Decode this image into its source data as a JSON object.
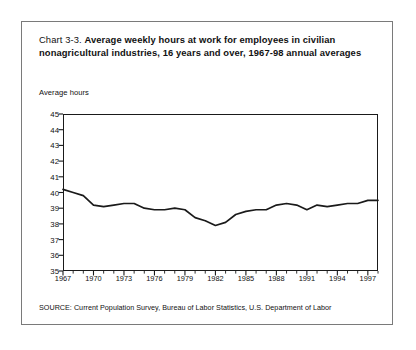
{
  "figure": {
    "number": "Chart 3-3.",
    "title": "Average weekly hours at work for employees in civilian nonagricultural industries, 16 years and over, 1967-98 annual averages",
    "y_axis_label": "Average hours",
    "source": "SOURCE: Current Population Survey, Bureau of Labor Statistics, U.S. Department of Labor",
    "line_color": "#1a1a1a",
    "frame_color": "#7a7a7a",
    "background": "#ffffff"
  },
  "chart_data": {
    "type": "line",
    "title": "Average weekly hours at work for employees in civilian nonagricultural industries, 16 years and over, 1967-98 annual averages",
    "xlabel": "",
    "ylabel": "Average hours",
    "xlim": [
      1967,
      1998
    ],
    "ylim": [
      35,
      45
    ],
    "yticks": [
      35,
      36,
      37,
      38,
      39,
      40,
      41,
      42,
      43,
      44,
      45
    ],
    "xticks": [
      1967,
      1970,
      1973,
      1976,
      1979,
      1982,
      1985,
      1988,
      1991,
      1994,
      1997
    ],
    "x_minor_tick_interval": 1,
    "grid": false,
    "legend": false,
    "series": [
      {
        "name": "Average weekly hours at work",
        "x": [
          1967,
          1968,
          1969,
          1970,
          1971,
          1972,
          1973,
          1974,
          1975,
          1976,
          1977,
          1978,
          1979,
          1980,
          1981,
          1982,
          1983,
          1984,
          1985,
          1986,
          1987,
          1988,
          1989,
          1990,
          1991,
          1992,
          1993,
          1994,
          1995,
          1996,
          1997,
          1998
        ],
        "values": [
          40.2,
          40.0,
          39.8,
          39.2,
          39.1,
          39.2,
          39.3,
          39.3,
          39.0,
          38.9,
          38.9,
          39.0,
          38.9,
          38.4,
          38.2,
          37.9,
          38.1,
          38.6,
          38.8,
          38.9,
          38.9,
          39.2,
          39.3,
          39.2,
          38.9,
          39.2,
          39.1,
          39.2,
          39.3,
          39.3,
          39.5,
          39.5
        ]
      }
    ]
  }
}
